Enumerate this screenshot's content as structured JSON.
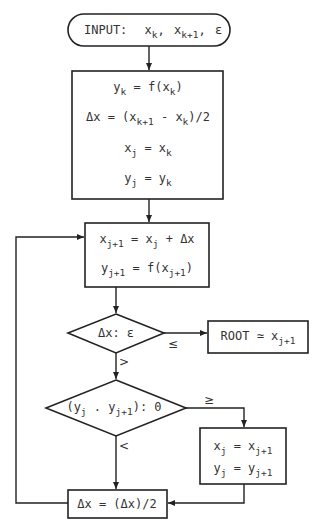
{
  "diagram": {
    "type": "flowchart",
    "colors": {
      "stroke": "#222222",
      "text": "#333333",
      "background": "#ffffff"
    },
    "nodes": {
      "input": {
        "shape": "terminal",
        "prefix": "INPUT:",
        "v1": "x",
        "v1sub": "k",
        "v2": "x",
        "v2sub": "k+1",
        "v3": "ε",
        "sep": ","
      },
      "init": {
        "shape": "process",
        "lines": [
          {
            "a": "y",
            "asub": "k",
            "mid": " = f(x",
            "msub": "k",
            "end": ")"
          },
          {
            "a": "Δx = (x",
            "asub": "k+1",
            "mid": " - x",
            "msub": "k",
            "end": ")/2"
          },
          {
            "a": "x",
            "asub": "j",
            "mid": " = x",
            "msub": "k",
            "end": ""
          },
          {
            "a": "y",
            "asub": "j",
            "mid": " = y",
            "msub": "k",
            "end": ""
          }
        ]
      },
      "step": {
        "shape": "process",
        "lines": [
          {
            "a": "x",
            "asub": "j+1",
            "mid": " = x",
            "msub": "j",
            "end": " + Δx"
          },
          {
            "a": "y",
            "asub": "j+1",
            "mid": " = f(x",
            "msub": "j+1",
            "end": ")"
          }
        ]
      },
      "test_eps": {
        "shape": "decision",
        "text": "Δx: ε",
        "yes_label": "≤",
        "no_label": ">"
      },
      "root": {
        "shape": "process",
        "prefix": "ROOT ≃ x",
        "sub": "j+1"
      },
      "test_sign": {
        "shape": "decision",
        "a": "(y",
        "asub": "j",
        "mid": " . y",
        "msub": "j+1",
        "end": "): 0",
        "ge_label": "≥",
        "lt_label": "<"
      },
      "update": {
        "shape": "process",
        "lines": [
          {
            "a": "x",
            "asub": "j",
            "mid": " = x",
            "msub": "j+1"
          },
          {
            "a": "y",
            "asub": "j",
            "mid": " = y",
            "msub": "j+1"
          }
        ]
      },
      "halve": {
        "shape": "process",
        "text": "Δx = (Δx)/2"
      }
    }
  }
}
